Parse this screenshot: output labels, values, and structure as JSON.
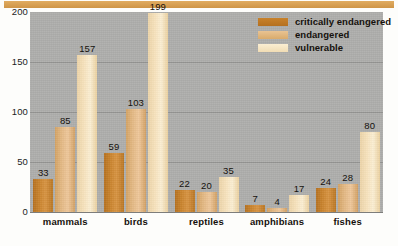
{
  "chart_data": {
    "type": "bar",
    "title": "",
    "xlabel": "",
    "ylabel": "",
    "ylim": [
      0,
      200
    ],
    "yticks": [
      0,
      50,
      100,
      150,
      200
    ],
    "grid": true,
    "legend_position": "top-right",
    "categories": [
      "mammals",
      "birds",
      "reptiles",
      "amphibians",
      "fishes"
    ],
    "series": [
      {
        "name": "critically endangered",
        "color": "#C8822B",
        "values": [
          33,
          59,
          22,
          7,
          24
        ]
      },
      {
        "name": "endangered",
        "color": "#E3B883",
        "values": [
          85,
          103,
          20,
          4,
          28
        ]
      },
      {
        "name": "vulnerable",
        "color": "#F7E2BC",
        "values": [
          157,
          199,
          35,
          17,
          80
        ]
      }
    ]
  },
  "legend": {
    "items": [
      {
        "label": "critically endangered"
      },
      {
        "label": "endangered"
      },
      {
        "label": "vulnerable"
      }
    ]
  },
  "colors": {
    "critically_endangered": "#C8822B",
    "endangered": "#E3B883",
    "vulnerable": "#F7E2BC",
    "plot_background": "#ADADAB",
    "top_band": "#D79F52"
  }
}
